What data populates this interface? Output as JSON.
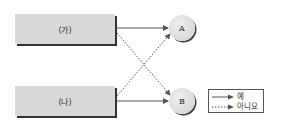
{
  "diagram": {
    "boxes": [
      {
        "id": "ga",
        "label": "(가)"
      },
      {
        "id": "na",
        "label": "(나)"
      }
    ],
    "nodes": [
      {
        "id": "A",
        "label": "A"
      },
      {
        "id": "B",
        "label": "B"
      }
    ],
    "edges": [
      {
        "from": "ga",
        "to": "A",
        "style": "solid"
      },
      {
        "from": "ga",
        "to": "B",
        "style": "dotted"
      },
      {
        "from": "na",
        "to": "A",
        "style": "dotted"
      },
      {
        "from": "na",
        "to": "B",
        "style": "solid"
      }
    ],
    "legend": {
      "solid_label": "예",
      "dotted_label": "아니요"
    },
    "colors": {
      "box_fill": "#d9d9d9",
      "line": "#555555",
      "shadow": "#333333"
    }
  }
}
